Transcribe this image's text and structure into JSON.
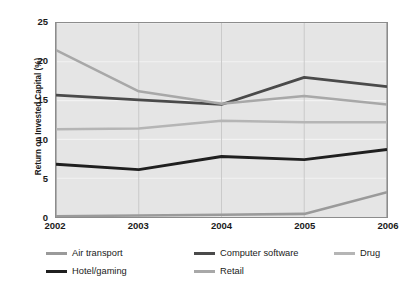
{
  "chart_data": {
    "type": "line",
    "title": "",
    "xlabel": "",
    "ylabel": "Return on Invested Capital (%)",
    "categories": [
      "2002",
      "2003",
      "2004",
      "2005",
      "2006"
    ],
    "x": [
      2002,
      2003,
      2004,
      2005,
      2006
    ],
    "ylim": [
      0,
      25
    ],
    "y_ticks": [
      0,
      5,
      10,
      15,
      20,
      25
    ],
    "y_tick_labels": [
      "0",
      "5",
      "10",
      "15",
      "20",
      "25"
    ],
    "grid": true,
    "grid_color": "#f2f2f2",
    "plot_background": "#e5e5e5",
    "legend_position": "bottom",
    "series": [
      {
        "name": "Air transport",
        "color": "#9a9a9a",
        "width": 2.6,
        "values": [
          0.1,
          0.2,
          0.3,
          0.4,
          3.2
        ]
      },
      {
        "name": "Computer software",
        "color": "#4a4a4a",
        "width": 2.8,
        "values": [
          15.7,
          15.1,
          14.5,
          18.0,
          16.8
        ]
      },
      {
        "name": "Drug",
        "color": "#b5b5b5",
        "width": 2.6,
        "values": [
          11.3,
          11.4,
          12.4,
          12.2,
          12.2
        ]
      },
      {
        "name": "Hotel/gaming",
        "color": "#1f1f1f",
        "width": 2.9,
        "values": [
          6.8,
          6.1,
          7.8,
          7.4,
          8.7
        ]
      },
      {
        "name": "Retail",
        "color": "#a8a8a8",
        "width": 2.6,
        "values": [
          21.5,
          16.2,
          14.6,
          15.6,
          14.5
        ]
      }
    ]
  },
  "legend": {
    "entries": [
      {
        "label": "Air transport",
        "color": "#9a9a9a",
        "row": 0,
        "col": 0
      },
      {
        "label": "Computer software",
        "color": "#4a4a4a",
        "row": 0,
        "col": 1
      },
      {
        "label": "Drug",
        "color": "#b5b5b5",
        "row": 0,
        "col": 2
      },
      {
        "label": "Hotel/gaming",
        "color": "#1f1f1f",
        "row": 1,
        "col": 0
      },
      {
        "label": "Retail",
        "color": "#a8a8a8",
        "row": 1,
        "col": 1
      }
    ]
  }
}
